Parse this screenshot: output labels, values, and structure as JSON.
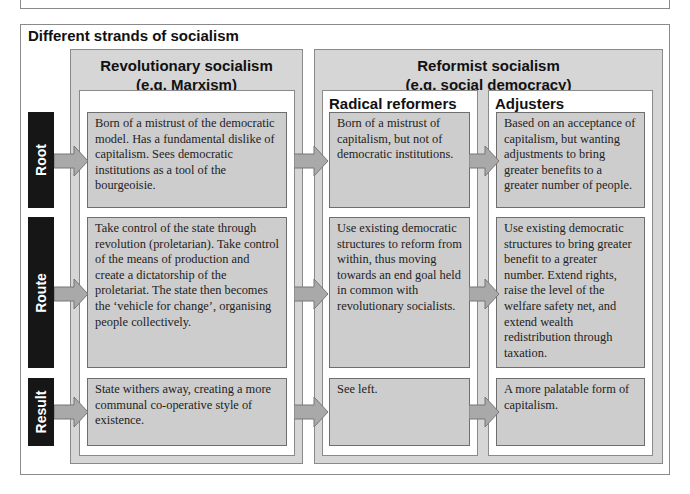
{
  "title": "Different strands of socialism",
  "columns": {
    "revolutionary": {
      "heading_line1": "Revolutionary socialism",
      "heading_line2": "(e.g. Marxism)"
    },
    "reformist": {
      "heading_line1": "Reformist socialism",
      "heading_line2": "(e.g. social democracy)"
    },
    "radical": {
      "heading": "Radical reformers"
    },
    "adjusters": {
      "heading": "Adjusters"
    }
  },
  "rows": {
    "root": {
      "label": "Root",
      "revolutionary": "Born of a mistrust of the democratic model. Has a fundamental dislike of capitalism. Sees democratic institutions as a tool of the bourgeoisie.",
      "radical": "Born of a mistrust of capitalism, but not of democratic institutions.",
      "adjusters": "Based on an acceptance of capitalism, but wanting adjustments to bring greater benefits to a greater number of people."
    },
    "route": {
      "label": "Route",
      "revolutionary": "Take control of the state through revolution (proletarian). Take control of the means of production and create a dictatorship of the proletariat. The state then becomes the ‘vehicle for change’, organising people collectively.",
      "radical": "Use existing democratic structures to reform from within, thus moving towards an end goal held in common with revolutionary socialists.",
      "adjusters": "Use existing democratic structures to bring greater benefit to a greater number. Extend rights, raise the level of the welfare safety net, and extend wealth redistribution through taxation."
    },
    "result": {
      "label": "Result",
      "revolutionary": "State withers away, creating a more communal co-operative style of existence.",
      "radical": "See left.",
      "adjusters": "A more palatable form of capitalism."
    }
  },
  "colors": {
    "label_bg": "#161616",
    "panel_bg": "#d6d6d6",
    "content_bg": "#cdcdcd",
    "arrow_fill": "#a9a9a9"
  }
}
